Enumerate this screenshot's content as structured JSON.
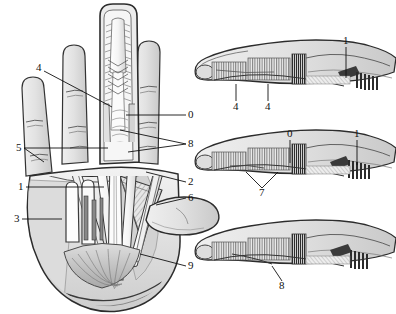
{
  "figure": {
    "background_color": "#ffffff",
    "ink_color": "#111111",
    "fill_light": "#e7e7e7",
    "fill_mid": "#cfcfcf",
    "fill_dark": "#9a9a9a",
    "hatch_color": "#555555"
  },
  "panels": [
    {
      "id": "palm",
      "name": "palmar-hand-dissection",
      "labels": [
        {
          "text": "4",
          "x": 36,
          "y": 71,
          "side": "left",
          "lx1": 44,
          "ly1": 71,
          "lx2": 112,
          "ly2": 107
        },
        {
          "text": "5",
          "x": 16,
          "y": 151,
          "side": "left",
          "lx1": 24,
          "ly1": 148,
          "lx2": 108,
          "ly2": 148
        },
        {
          "text": "1",
          "x": 18,
          "y": 190,
          "side": "left",
          "lx1": 26,
          "ly1": 187,
          "lx2": 104,
          "ly2": 187
        },
        {
          "text": "3",
          "x": 14,
          "y": 222,
          "side": "left",
          "lx1": 22,
          "ly1": 219,
          "lx2": 62,
          "ly2": 219
        },
        {
          "text": "0",
          "x": 188,
          "y": 118,
          "side": "right",
          "lx1": 186,
          "ly1": 115,
          "lx2": 126,
          "ly2": 115
        },
        {
          "text": "8",
          "x": 188,
          "y": 147,
          "side": "right",
          "lx1": 186,
          "ly1": 144,
          "lx2": 120,
          "ly2": 130
        },
        {
          "text": "2",
          "x": 188,
          "y": 185,
          "side": "right",
          "lx1": 186,
          "ly1": 182,
          "lx2": 146,
          "ly2": 172
        },
        {
          "text": "6",
          "x": 188,
          "y": 201,
          "side": "right",
          "lx1": 186,
          "ly1": 198,
          "lx2": 156,
          "ly2": 205
        },
        {
          "text": "9",
          "x": 188,
          "y": 269,
          "side": "right",
          "lx1": 186,
          "ly1": 266,
          "lx2": 140,
          "ly2": 254
        }
      ]
    },
    {
      "id": "finger-top",
      "name": "finger-lateral-view-top",
      "labels": [
        {
          "text": "1",
          "x": 343,
          "y": 44,
          "side": "top",
          "lx1": 346,
          "ly1": 47,
          "lx2": 346,
          "ly2": 78
        },
        {
          "text": "4",
          "x": 233,
          "y": 110,
          "side": "bottom",
          "lx1": 236,
          "ly1": 101,
          "lx2": 236,
          "ly2": 84
        },
        {
          "text": "4",
          "x": 265,
          "y": 110,
          "side": "bottom",
          "lx1": 268,
          "ly1": 101,
          "lx2": 268,
          "ly2": 84
        }
      ]
    },
    {
      "id": "finger-mid",
      "name": "finger-lateral-view-middle",
      "labels": [
        {
          "text": "0",
          "x": 287,
          "y": 137,
          "side": "top",
          "lx1": 290,
          "ly1": 140,
          "lx2": 290,
          "ly2": 163
        },
        {
          "text": "1",
          "x": 354,
          "y": 137,
          "side": "top",
          "lx1": 357,
          "ly1": 140,
          "lx2": 357,
          "ly2": 165
        },
        {
          "text": "7",
          "x": 259,
          "y": 196,
          "side": "bottom",
          "lx1": 262,
          "ly1": 188,
          "lx2": 246,
          "ly2": 172
        }
      ]
    },
    {
      "id": "finger-bot",
      "name": "finger-lateral-view-bottom",
      "labels": [
        {
          "text": "8",
          "x": 279,
          "y": 289,
          "side": "bottom",
          "lx1": 282,
          "ly1": 281,
          "lx2": 272,
          "ly2": 266
        }
      ]
    }
  ]
}
